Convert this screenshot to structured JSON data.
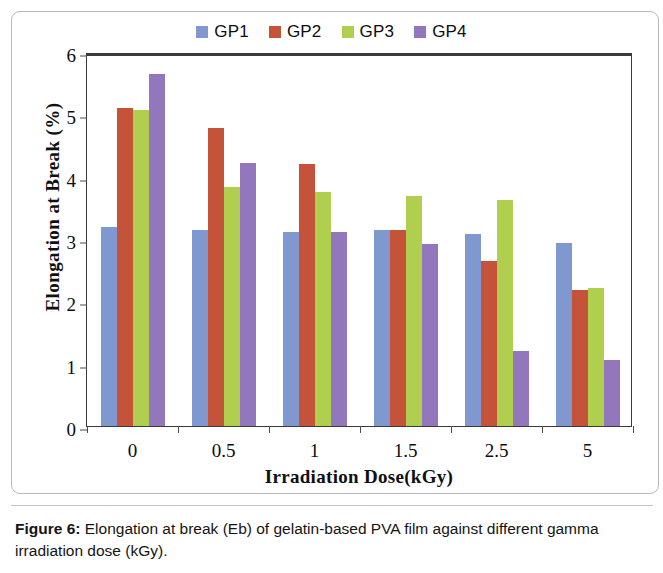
{
  "chart_data": {
    "type": "bar",
    "title": "",
    "categories": [
      "0",
      "0.5",
      "1",
      "1.5",
      "2.5",
      "5"
    ],
    "series": [
      {
        "name": "GP1",
        "color": "#8098d0",
        "values": [
          3.2,
          3.15,
          3.11,
          3.14,
          3.08,
          2.93
        ]
      },
      {
        "name": "GP2",
        "color": "#c5533a",
        "values": [
          5.1,
          4.78,
          4.2,
          3.14,
          2.65,
          2.18
        ]
      },
      {
        "name": "GP3",
        "color": "#b0cf4e",
        "values": [
          5.07,
          3.83,
          3.75,
          3.69,
          3.62,
          2.22
        ]
      },
      {
        "name": "GP4",
        "color": "#9377bd",
        "values": [
          5.65,
          4.22,
          3.11,
          2.92,
          1.21,
          1.06
        ]
      }
    ],
    "xlabel": "Irradiation Dose(kGy)",
    "ylabel": "Elongation at Break (%)",
    "ylim": [
      0,
      6
    ],
    "yticks": [
      "0",
      "1",
      "2",
      "3",
      "4",
      "5",
      "6"
    ],
    "grid": false,
    "legend_position": "top-center"
  },
  "caption": {
    "label": "Figure 6:",
    "text": " Elongation at break (Eb) of gelatin-based PVA film against different gamma irradiation dose (kGy)."
  }
}
